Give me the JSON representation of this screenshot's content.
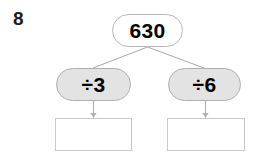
{
  "worksheet": {
    "question_number": "8",
    "top_node": {
      "label": "630"
    },
    "branches": [
      {
        "operation_label": "÷3",
        "answer_value": ""
      },
      {
        "operation_label": "÷6",
        "answer_value": ""
      }
    ],
    "colors": {
      "page_background": "#ffffff",
      "operation_fill": "#e3e3e3",
      "node_fill": "#ffffff",
      "node_border": "#b7b7b7",
      "box_border": "#c9c9c9",
      "connector_line": "#a8a8a8",
      "text": "#000000",
      "question_number_text": "#1b1b1b"
    }
  }
}
